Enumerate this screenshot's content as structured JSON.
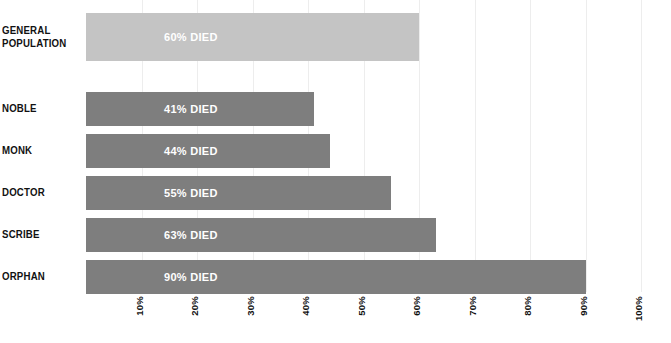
{
  "chart_data": {
    "type": "bar",
    "orientation": "horizontal",
    "title": "",
    "subtitle": "",
    "xlabel": "",
    "ylabel": "",
    "xlim": [
      0,
      100
    ],
    "grid": true,
    "legend": false,
    "categories": [
      "GENERAL POPULATION",
      "NOBLE",
      "MONK",
      "DOCTOR",
      "SCRIBE",
      "ORPHAN"
    ],
    "values": [
      60,
      41,
      44,
      55,
      63,
      90
    ],
    "bar_labels": [
      "60% DIED",
      "41% DIED",
      "44% DIED",
      "55% DIED",
      "63% DIED",
      "90% DIED"
    ],
    "xticks": [
      10,
      20,
      30,
      40,
      50,
      60,
      70,
      80,
      90,
      100
    ],
    "xticklabels": [
      "10%",
      "20%",
      "30%",
      "40%",
      "50%",
      "60%",
      "70%",
      "80%",
      "90%",
      "100%"
    ],
    "colors": {
      "bar_highlight": "#c4c4c4",
      "bar_default": "#7e7e7e",
      "gridline": "#ededed",
      "label_text": "#111111",
      "value_text": "#ffffff",
      "background": "#ffffff"
    },
    "series": [
      {
        "name": "Percent died",
        "values": [
          60,
          41,
          44,
          55,
          63,
          90
        ]
      }
    ]
  },
  "rows": [
    {
      "label_line1": "GENERAL",
      "label_line2": "POPULATION",
      "value": 60,
      "value_label": "60% DIED",
      "style": "light",
      "top": 13,
      "height": 48
    },
    {
      "label_line1": "NOBLE",
      "label_line2": "",
      "value": 41,
      "value_label": "41% DIED",
      "style": "dark",
      "top": 92,
      "height": 34
    },
    {
      "label_line1": "MONK",
      "label_line2": "",
      "value": 44,
      "value_label": "44% DIED",
      "style": "dark",
      "top": 134,
      "height": 34
    },
    {
      "label_line1": "DOCTOR",
      "label_line2": "",
      "value": 55,
      "value_label": "55% DIED",
      "style": "dark",
      "top": 176,
      "height": 34
    },
    {
      "label_line1": "SCRIBE",
      "label_line2": "",
      "value": 63,
      "value_label": "63% DIED",
      "style": "dark",
      "top": 218,
      "height": 34
    },
    {
      "label_line1": "ORPHAN",
      "label_line2": "",
      "value": 90,
      "value_label": "90% DIED",
      "style": "dark",
      "top": 260,
      "height": 34
    }
  ],
  "value_label_left_px": 78
}
